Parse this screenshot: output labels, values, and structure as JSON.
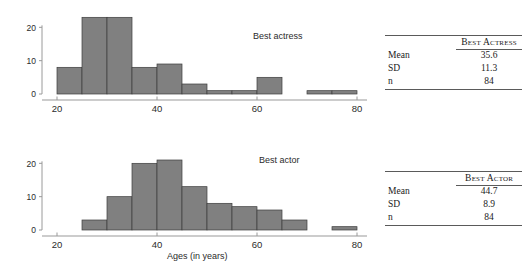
{
  "figure": {
    "x_axis_title": "Ages (in years)",
    "bar_fill_color": "#808080",
    "bar_edge_color": "#3d3d3d",
    "axis_color": "#9a9a9a",
    "text_color": "#2b2b2b"
  },
  "charts": [
    {
      "name": "best-actress-histogram",
      "series_label": "Best actress",
      "xlabel": "",
      "ylabel": "",
      "x_ticks": [
        20,
        40,
        60,
        80
      ],
      "x_tick_labels": [
        "20",
        "40",
        "60",
        "80"
      ],
      "y_ticks": [
        0,
        10,
        20
      ],
      "y_tick_labels": [
        "0",
        "10",
        "20"
      ],
      "xlim": [
        17,
        82
      ],
      "ylim": [
        0,
        24
      ]
    },
    {
      "name": "best-actor-histogram",
      "series_label": "Best actor",
      "xlabel": "Ages (in years)",
      "ylabel": "",
      "x_ticks": [
        20,
        40,
        60,
        80
      ],
      "x_tick_labels": [
        "20",
        "40",
        "60",
        "80"
      ],
      "y_ticks": [
        0,
        10,
        20
      ],
      "y_tick_labels": [
        "0",
        "10",
        "20"
      ],
      "xlim": [
        17,
        82
      ],
      "ylim": [
        0,
        24
      ]
    }
  ],
  "chart_data": [
    {
      "type": "bar",
      "title": "Best actress",
      "xlabel": "",
      "ylabel": "",
      "xlim": [
        17,
        82
      ],
      "ylim": [
        0,
        24
      ],
      "grid": false,
      "bin_width": 5,
      "bin_edges": [
        20,
        25,
        30,
        35,
        40,
        45,
        50,
        55,
        60,
        65,
        70,
        75,
        80
      ],
      "categories": [
        "20-25",
        "25-30",
        "30-35",
        "35-40",
        "40-45",
        "45-50",
        "50-55",
        "55-60",
        "60-65",
        "65-70",
        "70-75",
        "75-80"
      ],
      "values": [
        8,
        23,
        23,
        8,
        9,
        3,
        1,
        1,
        5,
        0,
        1,
        1
      ],
      "xticks": [
        20,
        40,
        60,
        80
      ],
      "yticks": [
        0,
        10,
        20
      ],
      "legend": "none"
    },
    {
      "type": "bar",
      "title": "Best actor",
      "xlabel": "Ages (in years)",
      "ylabel": "",
      "xlim": [
        17,
        82
      ],
      "ylim": [
        0,
        24
      ],
      "grid": false,
      "bin_width": 5,
      "bin_edges": [
        25,
        30,
        35,
        40,
        45,
        50,
        55,
        60,
        65,
        70,
        75,
        80
      ],
      "categories": [
        "25-30",
        "30-35",
        "35-40",
        "40-45",
        "45-50",
        "50-55",
        "55-60",
        "60-65",
        "65-70",
        "70-75",
        "75-80"
      ],
      "values": [
        3,
        10,
        20,
        21,
        13,
        8,
        7,
        6,
        3,
        0,
        1
      ],
      "xticks": [
        20,
        40,
        60,
        80
      ],
      "yticks": [
        0,
        10,
        20
      ],
      "legend": "none"
    }
  ],
  "tables": [
    {
      "name": "best-actress-stats",
      "header_blank": "",
      "header_value": "Best Actress",
      "rows": [
        {
          "label": "Mean",
          "value": "35.6"
        },
        {
          "label": "SD",
          "value": "11.3"
        },
        {
          "label": "n",
          "value": "84"
        }
      ]
    },
    {
      "name": "best-actor-stats",
      "header_blank": "",
      "header_value": "Best Actor",
      "rows": [
        {
          "label": "Mean",
          "value": "44.7"
        },
        {
          "label": "SD",
          "value": "8.9"
        },
        {
          "label": "n",
          "value": "84"
        }
      ]
    }
  ]
}
